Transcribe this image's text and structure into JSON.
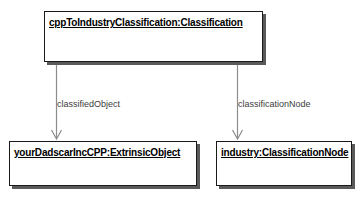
{
  "diagram": {
    "type": "uml-object-diagram",
    "background_color": "#ffffff",
    "line_color": "#8c8c8c",
    "border_color": "#1a1a1a",
    "shadow_color": "#5a5a5a",
    "label_color": "#3d3d3d",
    "objects": [
      {
        "id": "classification",
        "title": "cppToIndustryClassification:Classification"
      },
      {
        "id": "extrinsic-object",
        "title": "yourDadscarIncCPP:ExtrinsicObject"
      },
      {
        "id": "classification-node",
        "title": "industry:ClassificationNode"
      }
    ],
    "edges": [
      {
        "id": "classified-object-edge",
        "from": "classification",
        "to": "extrinsic-object",
        "label": "classifiedObject",
        "arrow": "open"
      },
      {
        "id": "classification-node-edge",
        "from": "classification",
        "to": "classification-node",
        "label": "classificationNode",
        "arrow": "open"
      }
    ]
  }
}
